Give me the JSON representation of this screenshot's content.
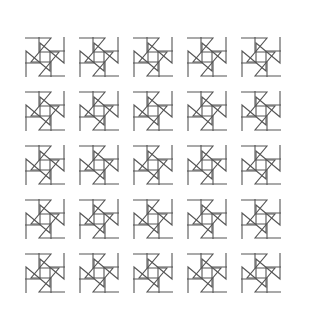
{
  "artwork": {
    "title": "Pinwheel Tessellation",
    "type": "geometric-line-pattern",
    "canvas": {
      "width": 319,
      "height": 331,
      "background_color": "#ffffff"
    },
    "stroke": {
      "color": "#555555",
      "width": 1.1
    },
    "tiling": {
      "columns": 5,
      "rows": 5,
      "cell_size": 54,
      "origin_x": 18,
      "origin_y": 30,
      "symmetry": "p4 (4-fold rotational)",
      "motif_name": "pinwheel-z-arm"
    },
    "motif": {
      "description": "Four congruent stepped Z-shaped arms arranged with 90-degree rotational symmetry about the cell centre; each arm consists of a short edge, a long diagonal crossing the centre, and a stepped return.",
      "arm_count": 4,
      "arm_rotations_deg": [
        0,
        90,
        180,
        270
      ],
      "arm_points": [
        [
          -20,
          -19
        ],
        [
          6,
          -19
        ],
        [
          -14,
          5
        ],
        [
          6,
          5
        ],
        [
          6,
          20
        ]
      ]
    }
  }
}
